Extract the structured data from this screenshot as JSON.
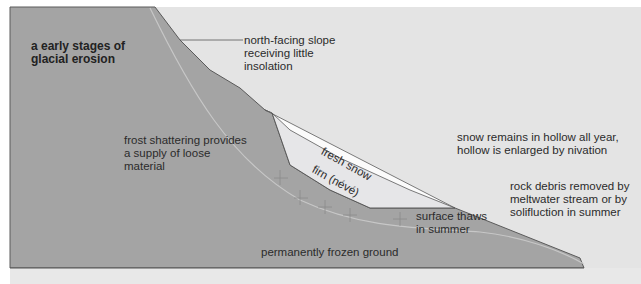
{
  "figure": {
    "panel_letter": "a",
    "title_line1": "a  early stages of",
    "title_line2": "glacial erosion"
  },
  "colors": {
    "background": "#e4e4e4",
    "ground": "#a4a4a4",
    "ground_outline": "#5a5a5a",
    "fresh_snow": "#fbfbfb",
    "firn": "#e6e6e8",
    "text": "#2b2b2b"
  },
  "labels": {
    "north_slope": [
      "north-facing slope",
      "receiving little",
      "insolation"
    ],
    "frost_shattering": [
      "frost shattering provides",
      "a supply of loose",
      "material"
    ],
    "fresh_snow": "fresh snow",
    "firn": "firn (névé)",
    "snow_remains": [
      "snow remains in hollow all year,",
      "hollow is enlarged by nivation"
    ],
    "rock_debris": [
      "rock debris removed by",
      "meltwater stream or by",
      "solifluction in summer"
    ],
    "surface_thaws": [
      "surface thaws",
      "in summer"
    ],
    "permafrost": "permanently frozen ground"
  }
}
